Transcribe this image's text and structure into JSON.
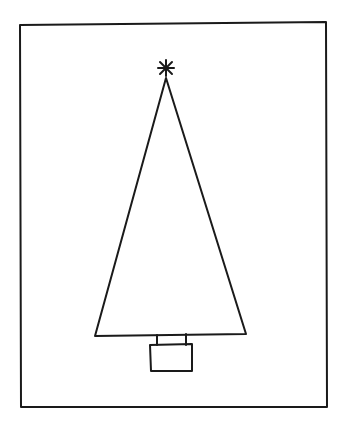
{
  "drawing": {
    "subject": "christmas-tree",
    "style": "hand-drawn line art",
    "colors": {
      "background": "#ffffff",
      "ink": "#1a1a1a"
    },
    "frame": {
      "points": "20,25 326,22 327,407 21,407"
    },
    "tree": {
      "points": "166,78 246,334 95,336"
    },
    "star": {
      "cx": 166,
      "cy": 68,
      "r": 8
    },
    "trunk": {
      "left_x": 157,
      "right_x": 186,
      "top_y": 335,
      "bottom_y": 345
    },
    "pot": {
      "x": 150,
      "y": 344,
      "width": 42,
      "height": 27
    }
  }
}
